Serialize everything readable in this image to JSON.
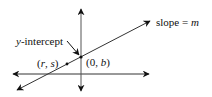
{
  "diagram": {
    "type": "coordinate-line-diagram",
    "labels": {
      "slope": "slope = ",
      "slope_var": "m",
      "y_intercept": "y-intercept",
      "y_intercept_var": "y",
      "y_intercept_rest": "-intercept",
      "point_rs_open": "(",
      "point_rs_r": "r",
      "point_rs_comma": ", ",
      "point_rs_s": "s",
      "point_rs_close": ")",
      "point_0b_open": "(0, ",
      "point_0b_b": "b",
      "point_0b_close": ")"
    },
    "points": [
      {
        "name": "(r, s)",
        "x": 67,
        "y": 64
      },
      {
        "name": "(0, b)",
        "x": 81,
        "y": 57
      }
    ],
    "colors": {
      "stroke": "#111111",
      "axis": "#555555"
    }
  }
}
